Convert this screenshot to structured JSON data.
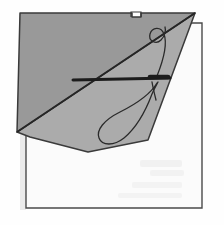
{
  "figure": {
    "title": "Sewing diagram: needle and looped thread through folded fabric",
    "type": "line-drawing",
    "background_color": "#fefefe",
    "canvas": {
      "width": 224,
      "height": 225
    }
  },
  "colors": {
    "base_cloth_fill": "#fbfbfb",
    "base_cloth_stroke": "#4a4a4a",
    "upper_flap_fill": "#999999",
    "lower_flap_fill": "#ababab",
    "flap_stroke": "#3a3a3a",
    "fold_line": "#262626",
    "needle": "#1c1c1c",
    "thread": "#2a2a2a",
    "smudge": "#e9e9e9",
    "paper_edge_shadow": "#d8d8d8"
  },
  "shapes": {
    "base_cloth": {
      "name": "base-cloth-square",
      "label": "White fabric square",
      "points": "26,23 202,23 202,208 26,208"
    },
    "upper_flap": {
      "name": "folded-flap-upper",
      "label": "Darker folded-back flap (upper-left triangle)",
      "points": "20,13 132,13 132,17 141,17 141,13 195,13 17,132"
    },
    "lower_flap": {
      "name": "folded-flap-lower",
      "label": "Lighter folded flap (lower wedge)",
      "points": "195,13 17,132 30,137 88,152 148,140"
    },
    "fold_line": {
      "name": "fold-crease-line",
      "label": "Diagonal fold crease",
      "points": "195,13 17,132"
    },
    "flap_tab": {
      "name": "flap-corner-tab",
      "label": "Small tab notch at top edge of flap",
      "points": "131,17 131,12 141,12 141,17"
    }
  },
  "needle": {
    "name": "sewing-needle",
    "label": "Needle passing through fabric",
    "path": "M 73,80 L 170,78",
    "eye_path": "M 150,77 L 168,77",
    "tip": {
      "x": 73,
      "y": 80
    },
    "head": {
      "x": 170,
      "y": 78
    },
    "width_px": 3
  },
  "thread": {
    "name": "thread-loop",
    "label": "Thread forming a large teardrop loop with a small curl",
    "loop_path": "M 157,83 C 150,95 136,104 120,112 C 104,120 96,130 99,138 C 102,146 114,146 124,138 C 136,128 146,110 152,94 C 155,87 157,84 158,82",
    "curl_path": "M 157,76 C 161,66 168,45 164,34 C 161,26 152,27 150,34 C 148,41 156,45 161,40 C 165,36 166,30 165,27",
    "tail_path": "M 152,82 C 153,88 155,96 156,100",
    "stroke_width": 1.3
  },
  "smudges": [
    {
      "name": "scan-smudge-1",
      "x": 140,
      "y": 160,
      "w": 42,
      "h": 7,
      "opacity": 0.55
    },
    {
      "name": "scan-smudge-2",
      "x": 150,
      "y": 170,
      "w": 34,
      "h": 6,
      "opacity": 0.5
    },
    {
      "name": "scan-smudge-3",
      "x": 132,
      "y": 182,
      "w": 50,
      "h": 6,
      "opacity": 0.45
    },
    {
      "name": "scan-smudge-4",
      "x": 118,
      "y": 193,
      "w": 64,
      "h": 5,
      "opacity": 0.4
    }
  ],
  "annotations": {
    "figure_caption": "",
    "visible_text": []
  }
}
